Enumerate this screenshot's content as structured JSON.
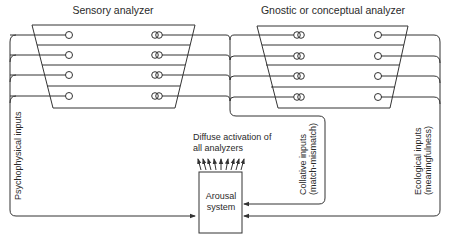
{
  "diagram": {
    "left_analyzer": {
      "title": "Sensory analyzer",
      "rows": 4,
      "left_node": "single-circle",
      "right_node": "double-circle"
    },
    "right_analyzer": {
      "title": "Gnostic or conceptual analyzer",
      "rows": 4,
      "left_node": "double-circle",
      "right_node": "single-circle"
    },
    "arousal_box": {
      "line1": "Arousal",
      "line2": "system"
    },
    "diffuse_label": {
      "line1": "Diffuse activation of",
      "line2": "all analyzers",
      "arrow_count": 9
    },
    "inputs": {
      "psychophysical": "Psychophysical inputs",
      "collative_line1": "Collative inputs",
      "collative_line2": "(match-mismatch)",
      "ecological_line1": "Ecological inputs",
      "ecological_line2": "(meaningfulness)"
    },
    "colors": {
      "line": "#333333",
      "text": "#2a2a2a",
      "background": "#ffffff"
    }
  }
}
